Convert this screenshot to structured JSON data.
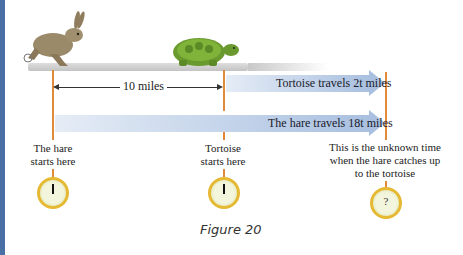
{
  "figure": {
    "caption": "Figure 20",
    "distance_label": "10 miles",
    "tortoise_arrow_label": "Tortoise travels 2t miles",
    "hare_arrow_label": "The hare travels 18t miles",
    "hare_start_label_line1": "The hare",
    "hare_start_label_line2": "starts here",
    "tortoise_start_label_line1": "Tortoise",
    "tortoise_start_label_line2": "starts here",
    "unknown_label_line1": "This is the unknown time",
    "unknown_label_line2": "when the hare catches up",
    "unknown_label_line3": "to the tortoise",
    "unknown_clock_symbol": "?",
    "colors": {
      "left_bar": "#4a6fa5",
      "marker_line": "#e08a3c",
      "arrow_band": "#a9c0e0",
      "clock_rim": "#e6b935"
    }
  }
}
